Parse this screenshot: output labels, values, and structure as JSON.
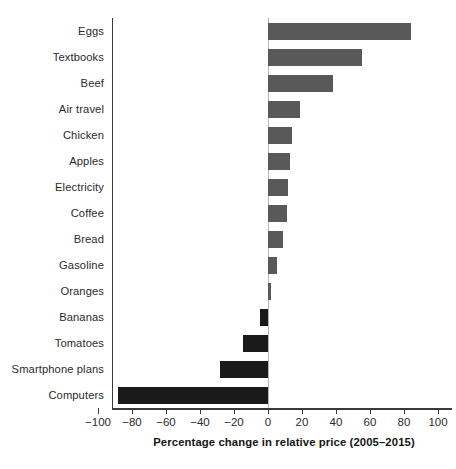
{
  "chart_data": {
    "type": "bar",
    "orientation": "horizontal",
    "title": "",
    "xlabel": "Percentage change in relative price (2005–2015)",
    "ylabel": "",
    "categories": [
      "Eggs",
      "Textbooks",
      "Beef",
      "Air travel",
      "Chicken",
      "Apples",
      "Electricity",
      "Coffee",
      "Bread",
      "Gasoline",
      "Oranges",
      "Bananas",
      "Tomatoes",
      "Smartphone plans",
      "Computers"
    ],
    "values": [
      84,
      55,
      38,
      19,
      14,
      13,
      12,
      11,
      9,
      5,
      2,
      -5,
      -15,
      -28,
      -88
    ],
    "xlim": [
      -100,
      100
    ],
    "xticks": [
      -100,
      -80,
      -60,
      -40,
      -20,
      0,
      20,
      40,
      60,
      80,
      100
    ],
    "xtick_labels": [
      "−100",
      "−80",
      "−60",
      "−40",
      "−20",
      "0",
      "20",
      "40",
      "60",
      "80",
      "100"
    ],
    "grid": false,
    "legend": false,
    "colors": {
      "positive_bar": "#595959",
      "negative_bar": "#1a1a1a",
      "axis": "#3a3a3a",
      "zero_line": "#b9b9b9",
      "text": "#2b2b2b",
      "background": "#ffffff"
    }
  }
}
